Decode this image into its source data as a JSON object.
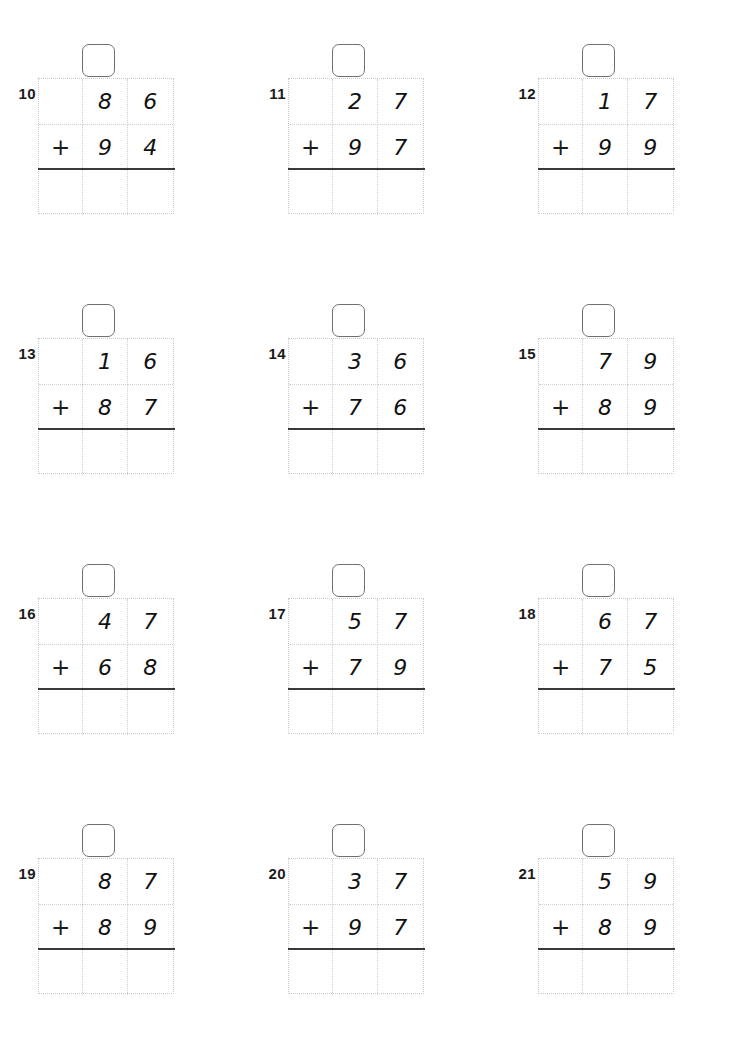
{
  "worksheet": {
    "title": "Two-digit addition with regrouping",
    "operator": "+",
    "columns_per_grid": 3,
    "rows_per_grid": 3
  },
  "problems": [
    {
      "number": "10",
      "top_tens": "8",
      "top_ones": "6",
      "operator": "+",
      "bottom_tens": "9",
      "bottom_ones": "4",
      "carry": "",
      "answer_tens": "",
      "answer_ones": "",
      "answer_hundreds": ""
    },
    {
      "number": "11",
      "top_tens": "2",
      "top_ones": "7",
      "operator": "+",
      "bottom_tens": "9",
      "bottom_ones": "7",
      "carry": "",
      "answer_tens": "",
      "answer_ones": "",
      "answer_hundreds": ""
    },
    {
      "number": "12",
      "top_tens": "1",
      "top_ones": "7",
      "operator": "+",
      "bottom_tens": "9",
      "bottom_ones": "9",
      "carry": "",
      "answer_tens": "",
      "answer_ones": "",
      "answer_hundreds": ""
    },
    {
      "number": "13",
      "top_tens": "1",
      "top_ones": "6",
      "operator": "+",
      "bottom_tens": "8",
      "bottom_ones": "7",
      "carry": "",
      "answer_tens": "",
      "answer_ones": "",
      "answer_hundreds": ""
    },
    {
      "number": "14",
      "top_tens": "3",
      "top_ones": "6",
      "operator": "+",
      "bottom_tens": "7",
      "bottom_ones": "6",
      "carry": "",
      "answer_tens": "",
      "answer_ones": "",
      "answer_hundreds": ""
    },
    {
      "number": "15",
      "top_tens": "7",
      "top_ones": "9",
      "operator": "+",
      "bottom_tens": "8",
      "bottom_ones": "9",
      "carry": "",
      "answer_tens": "",
      "answer_ones": "",
      "answer_hundreds": ""
    },
    {
      "number": "16",
      "top_tens": "4",
      "top_ones": "7",
      "operator": "+",
      "bottom_tens": "6",
      "bottom_ones": "8",
      "carry": "",
      "answer_tens": "",
      "answer_ones": "",
      "answer_hundreds": ""
    },
    {
      "number": "17",
      "top_tens": "5",
      "top_ones": "7",
      "operator": "+",
      "bottom_tens": "7",
      "bottom_ones": "9",
      "carry": "",
      "answer_tens": "",
      "answer_ones": "",
      "answer_hundreds": ""
    },
    {
      "number": "18",
      "top_tens": "6",
      "top_ones": "7",
      "operator": "+",
      "bottom_tens": "7",
      "bottom_ones": "5",
      "carry": "",
      "answer_tens": "",
      "answer_ones": "",
      "answer_hundreds": ""
    },
    {
      "number": "19",
      "top_tens": "8",
      "top_ones": "7",
      "operator": "+",
      "bottom_tens": "8",
      "bottom_ones": "9",
      "carry": "",
      "answer_tens": "",
      "answer_ones": "",
      "answer_hundreds": ""
    },
    {
      "number": "20",
      "top_tens": "3",
      "top_ones": "7",
      "operator": "+",
      "bottom_tens": "9",
      "bottom_ones": "7",
      "carry": "",
      "answer_tens": "",
      "answer_ones": "",
      "answer_hundreds": ""
    },
    {
      "number": "21",
      "top_tens": "5",
      "top_ones": "9",
      "operator": "+",
      "bottom_tens": "8",
      "bottom_ones": "9",
      "carry": "",
      "answer_tens": "",
      "answer_ones": "",
      "answer_hundreds": ""
    }
  ],
  "colors": {
    "grid_line": "#cfcfcf",
    "answer_rule": "#3a3a3a",
    "carry_box_border": "#6e7073",
    "digit": "#111111",
    "number_label": "#1b1b1b"
  }
}
